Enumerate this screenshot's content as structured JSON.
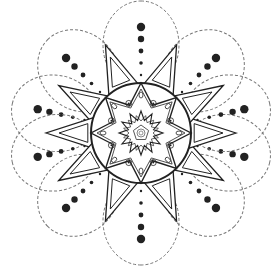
{
  "image": {
    "description": "Black-and-white mandala line drawing",
    "background": "#ffffff",
    "stroke": "#222222",
    "dashed_stroke": "#777777",
    "center": [
      141,
      133
    ],
    "circle_radius": 50,
    "petal_angles_deg": [
      -90,
      -135,
      -167,
      167,
      135,
      90,
      45,
      13,
      -13,
      -45
    ],
    "petal_count": 10
  }
}
